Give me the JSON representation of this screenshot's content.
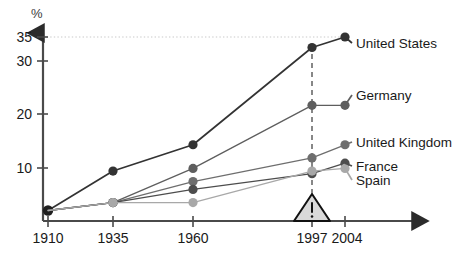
{
  "chart_data": {
    "type": "line",
    "title": "",
    "xlabel": "",
    "ylabel": "%",
    "x": [
      1910,
      1935,
      1960,
      1997,
      2004
    ],
    "categories": [
      "1910",
      "1935",
      "1960",
      "1997",
      "2004"
    ],
    "xtick_labels": [
      "1910",
      "1935",
      "1960",
      "1997",
      "2004"
    ],
    "ytick_labels": [
      "10",
      "20",
      "30",
      "35"
    ],
    "ytick_values": [
      10,
      20,
      30,
      35
    ],
    "ylim": [
      0,
      36
    ],
    "xlim": [
      1903,
      2012
    ],
    "grid": "dotted-horizontal-at-35",
    "legend_position": "right-inline-labels",
    "series": [
      {
        "name": "United States",
        "label": "United States",
        "color": "#333333",
        "values": [
          2,
          9.5,
          14.5,
          33,
          35
        ]
      },
      {
        "name": "Germany",
        "label": "Germany",
        "color": "#5e5e5e",
        "values": [
          2,
          3.5,
          10,
          22,
          22
        ]
      },
      {
        "name": "United Kingdom",
        "label": "United Kingdom",
        "color": "#6e6e6e",
        "values": [
          2,
          3.5,
          7.5,
          12,
          14.5
        ]
      },
      {
        "name": "France",
        "label": "France",
        "color": "#4d4d4d",
        "values": [
          2,
          3.5,
          6,
          9,
          11
        ]
      },
      {
        "name": "Spain",
        "label": "Spain",
        "color": "#a8a8a8",
        "values": [
          2,
          3.5,
          3.5,
          9.5,
          10
        ]
      }
    ],
    "annotations": [
      {
        "name": "warning-marker",
        "symbol": "!",
        "shape": "triangle",
        "at_x": 1997,
        "description": "warning triangle with exclamation mark at 1997"
      },
      {
        "name": "reference-line",
        "style": "dashed-vertical",
        "at_x": 1997
      }
    ]
  },
  "axis": {
    "y_unit": "%"
  }
}
